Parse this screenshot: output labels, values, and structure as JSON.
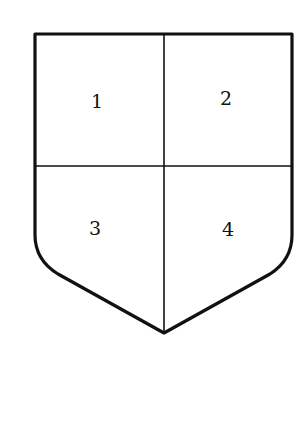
{
  "diagram": {
    "type": "heraldic-shield",
    "division": "quarterly",
    "stroke_color": "#111111",
    "fill_color": "#ffffff",
    "quarters": [
      {
        "label": "1",
        "position": "upper-left"
      },
      {
        "label": "2",
        "position": "upper-right"
      },
      {
        "label": "3",
        "position": "lower-left"
      },
      {
        "label": "4",
        "position": "lower-right"
      }
    ]
  }
}
